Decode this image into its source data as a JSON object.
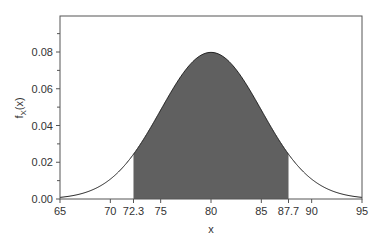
{
  "chart_data": {
    "type": "area",
    "title": "",
    "xlabel": "x",
    "ylabel": "f_X(x)",
    "distribution": "normal",
    "mean": 80,
    "std_dev": 5,
    "shaded_interval": [
      72.3,
      87.7
    ],
    "xlim": [
      65,
      95
    ],
    "ylim": [
      0,
      0.1
    ],
    "x_ticks": [
      "65",
      "70",
      "72.3",
      "75",
      "80",
      "85",
      "87.7",
      "90",
      "95"
    ],
    "x_tick_values": [
      65,
      70,
      72.3,
      75,
      80,
      85,
      87.7,
      90,
      95
    ],
    "y_ticks": [
      "0.00",
      "0.02",
      "0.04",
      "0.06",
      "0.08"
    ],
    "y_tick_values": [
      0,
      0.02,
      0.04,
      0.06,
      0.08
    ],
    "peak": {
      "x": 80,
      "y": 0.0798
    },
    "grid": false,
    "colors": {
      "shade": "#606060",
      "curve": "#222222",
      "frame": "#555555"
    }
  }
}
